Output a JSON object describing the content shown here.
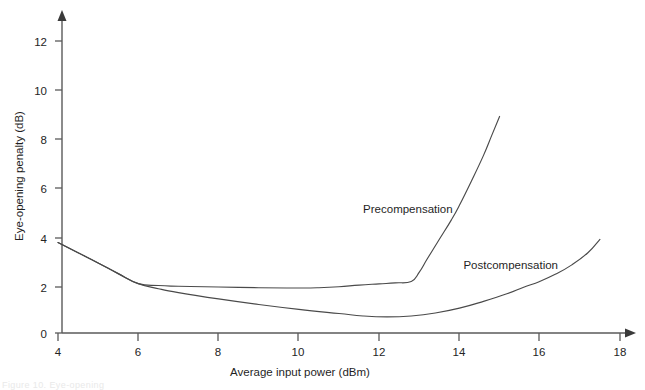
{
  "figure": {
    "background_color": "#ffffff",
    "line_color": "#4a4a4a",
    "axis_color": "#5a5a5a",
    "text_color": "#1f1f1f",
    "caption_fragment": "Figure 10.  Eye-opening"
  },
  "chart_data": {
    "type": "line",
    "title": "",
    "subtitle": "",
    "xlabel": "Average input power (dBm)",
    "ylabel": "Eye-opening penalty (dB)",
    "xlim": [
      4,
      18
    ],
    "ylim": [
      0,
      13
    ],
    "xticks": [
      4,
      6,
      8,
      10,
      12,
      14,
      16,
      18
    ],
    "xticklabels": [
      "4",
      "6",
      "8",
      "10",
      "12",
      "14",
      "16",
      "18"
    ],
    "yticks": [
      0,
      2,
      4,
      6,
      8,
      10,
      12
    ],
    "yticklabels": [
      "0",
      "2",
      "4",
      "6",
      "8",
      "10",
      "12"
    ],
    "grid": false,
    "legend": "inline-annotations",
    "legend_position": "inline",
    "annotations": [
      {
        "text": "Precompensation",
        "x": 11.6,
        "y": 4.95
      },
      {
        "text": "Postcompensation",
        "x": 14.1,
        "y": 2.62
      }
    ],
    "series": [
      {
        "name": "Precompensation",
        "points": [
          [
            4.0,
            3.72
          ],
          [
            4.5,
            3.3
          ],
          [
            5.0,
            2.88
          ],
          [
            5.5,
            2.44
          ],
          [
            6.0,
            2.03
          ],
          [
            6.5,
            1.95
          ],
          [
            7.0,
            1.92
          ],
          [
            8.0,
            1.89
          ],
          [
            9.0,
            1.86
          ],
          [
            10.0,
            1.85
          ],
          [
            10.5,
            1.86
          ],
          [
            11.0,
            1.9
          ],
          [
            11.5,
            1.97
          ],
          [
            12.0,
            2.02
          ],
          [
            12.4,
            2.06
          ],
          [
            12.8,
            2.12
          ],
          [
            13.0,
            2.5
          ],
          [
            13.2,
            3.05
          ],
          [
            13.5,
            3.85
          ],
          [
            13.8,
            4.65
          ],
          [
            14.0,
            5.25
          ],
          [
            14.3,
            6.25
          ],
          [
            14.6,
            7.3
          ],
          [
            14.8,
            8.1
          ],
          [
            15.0,
            8.9
          ]
        ]
      },
      {
        "name": "Postcompensation",
        "points": [
          [
            4.0,
            3.72
          ],
          [
            4.5,
            3.3
          ],
          [
            5.0,
            2.88
          ],
          [
            5.5,
            2.44
          ],
          [
            6.0,
            2.03
          ],
          [
            6.5,
            1.82
          ],
          [
            7.0,
            1.66
          ],
          [
            8.0,
            1.4
          ],
          [
            9.0,
            1.17
          ],
          [
            10.0,
            0.97
          ],
          [
            11.0,
            0.8
          ],
          [
            11.6,
            0.7
          ],
          [
            12.2,
            0.66
          ],
          [
            12.8,
            0.7
          ],
          [
            13.4,
            0.82
          ],
          [
            14.0,
            1.02
          ],
          [
            14.6,
            1.3
          ],
          [
            15.2,
            1.62
          ],
          [
            15.6,
            1.88
          ],
          [
            16.0,
            2.12
          ],
          [
            16.4,
            2.42
          ],
          [
            16.8,
            2.8
          ],
          [
            17.2,
            3.3
          ],
          [
            17.5,
            3.85
          ]
        ]
      }
    ]
  }
}
